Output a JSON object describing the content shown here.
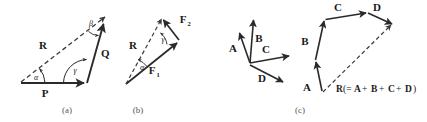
{
  "figure": {
    "background_color": "#ffffff",
    "stroke_color": "#2a2a2a",
    "panels": [
      {
        "id": "a",
        "caption": "(a)",
        "vectors": [
          {
            "name": "P",
            "label": "P",
            "style": "solid"
          },
          {
            "name": "Q",
            "label": "Q",
            "style": "solid"
          },
          {
            "name": "R",
            "label": "R",
            "style": "dashed"
          }
        ],
        "angles": [
          {
            "name": "alpha",
            "label": "α"
          },
          {
            "name": "beta",
            "label": "β"
          },
          {
            "name": "gamma",
            "label": "γ"
          }
        ]
      },
      {
        "id": "b",
        "caption": "(b)",
        "vectors": [
          {
            "name": "F1",
            "label": "F",
            "subscript": "1",
            "style": "solid"
          },
          {
            "name": "F2",
            "label": "F",
            "subscript": "2",
            "style": "solid"
          },
          {
            "name": "R",
            "label": "R",
            "style": "dashed"
          }
        ],
        "angles": [
          {
            "name": "alpha",
            "label": "α"
          },
          {
            "name": "gamma",
            "label": "γ"
          }
        ]
      },
      {
        "id": "c",
        "caption": "(c)",
        "vectors": [
          {
            "name": "A",
            "label": "A",
            "style": "solid"
          },
          {
            "name": "B",
            "label": "B",
            "style": "solid"
          },
          {
            "name": "C",
            "label": "C",
            "style": "solid"
          },
          {
            "name": "D",
            "label": "D",
            "style": "solid"
          },
          {
            "name": "R",
            "label": "R",
            "style": "dashed"
          }
        ],
        "resultant_equation": {
          "symbol": "R",
          "open": "(=",
          "terms": [
            "A",
            "B",
            "C",
            "D"
          ],
          "operator": "+",
          "close": ")",
          "full_text": "R(=A+B+C+D)"
        }
      }
    ]
  },
  "labels": {
    "panel_a": {
      "P": "P",
      "Q": "Q",
      "R": "R",
      "alpha": "α",
      "beta": "β",
      "gamma": "γ",
      "caption": "(a)"
    },
    "panel_b": {
      "F": "F",
      "F1_sub": "1",
      "F2_sub": "2",
      "R": "R",
      "alpha": "α",
      "gamma": "γ",
      "caption": "(b)"
    },
    "panel_c": {
      "A": "A",
      "B": "B",
      "C": "C",
      "D": "D",
      "A2": "A",
      "B2": "B",
      "C2": "C",
      "D2": "D",
      "R": "R",
      "eq_open": "(=",
      "eq_a": "A",
      "eq_plus1": "+",
      "eq_b": "B",
      "eq_plus2": "+",
      "eq_c": "C",
      "eq_plus3": "+",
      "eq_d": "D",
      "eq_close": ")",
      "caption": "(c)"
    }
  }
}
